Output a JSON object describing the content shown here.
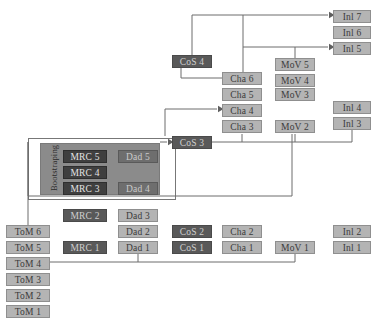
{
  "diagram": {
    "bootstrapping_label": "Bootstraping",
    "colors": {
      "node_fill": "#b4b4b4",
      "node_dark_fill": "#595959",
      "panel_fill": "#8b8b8b",
      "wire": "#6d6d6d",
      "page_background": "#ffffff"
    },
    "columns": [
      {
        "name": "ToM",
        "label": "ToM"
      },
      {
        "name": "MRC",
        "label": "MRC"
      },
      {
        "name": "Dad",
        "label": "Dad"
      },
      {
        "name": "CoS",
        "label": "CoS"
      },
      {
        "name": "Cha",
        "label": "Cha"
      },
      {
        "name": "MoV",
        "label": "MoV"
      },
      {
        "name": "Inl",
        "label": "Inl"
      }
    ],
    "nodes": [
      {
        "id": "tom6",
        "label": "ToM 6",
        "x": 6,
        "y": 225,
        "w": 44,
        "style": "light"
      },
      {
        "id": "tom5",
        "label": "ToM 5",
        "x": 6,
        "y": 241,
        "w": 44,
        "style": "light"
      },
      {
        "id": "tom4",
        "label": "ToM 4",
        "x": 6,
        "y": 257,
        "w": 44,
        "style": "light"
      },
      {
        "id": "tom3",
        "label": "ToM 3",
        "x": 6,
        "y": 273,
        "w": 44,
        "style": "light"
      },
      {
        "id": "tom2",
        "label": "ToM 2",
        "x": 6,
        "y": 289,
        "w": 44,
        "style": "light"
      },
      {
        "id": "tom1",
        "label": "ToM 1",
        "x": 6,
        "y": 305,
        "w": 44,
        "style": "light"
      },
      {
        "id": "mrc5",
        "label": "MRC 5",
        "x": 63,
        "y": 150,
        "w": 44,
        "style": "panel-dark"
      },
      {
        "id": "mrc4",
        "label": "MRC 4",
        "x": 63,
        "y": 166,
        "w": 44,
        "style": "panel-dark"
      },
      {
        "id": "mrc3",
        "label": "MRC 3",
        "x": 63,
        "y": 182,
        "w": 44,
        "style": "panel-dark"
      },
      {
        "id": "mrc2",
        "label": "MRC 2",
        "x": 63,
        "y": 209,
        "w": 44,
        "style": "dark"
      },
      {
        "id": "mrc1",
        "label": "MRC 1",
        "x": 63,
        "y": 241,
        "w": 44,
        "style": "dark"
      },
      {
        "id": "dad5",
        "label": "Dad 5",
        "x": 118,
        "y": 150,
        "w": 40,
        "style": "panel-soft"
      },
      {
        "id": "dad4",
        "label": "Dad 4",
        "x": 118,
        "y": 182,
        "w": 40,
        "style": "panel-soft"
      },
      {
        "id": "dad3",
        "label": "Dad 3",
        "x": 118,
        "y": 209,
        "w": 40,
        "style": "light"
      },
      {
        "id": "dad2",
        "label": "Dad 2",
        "x": 118,
        "y": 225,
        "w": 40,
        "style": "light"
      },
      {
        "id": "dad1",
        "label": "Dad 1",
        "x": 118,
        "y": 241,
        "w": 40,
        "style": "light"
      },
      {
        "id": "cos4",
        "label": "CoS 4",
        "x": 172,
        "y": 55,
        "w": 40,
        "style": "dark"
      },
      {
        "id": "cos3",
        "label": "CoS 3",
        "x": 172,
        "y": 136,
        "w": 40,
        "style": "dark"
      },
      {
        "id": "cos2",
        "label": "CoS 2",
        "x": 172,
        "y": 225,
        "w": 40,
        "style": "dark"
      },
      {
        "id": "cos1",
        "label": "CoS 1",
        "x": 172,
        "y": 241,
        "w": 40,
        "style": "dark"
      },
      {
        "id": "cha6",
        "label": "Cha 6",
        "x": 222,
        "y": 72,
        "w": 40,
        "style": "light"
      },
      {
        "id": "cha5",
        "label": "Cha 5",
        "x": 222,
        "y": 88,
        "w": 40,
        "style": "light"
      },
      {
        "id": "cha4",
        "label": "Cha 4",
        "x": 222,
        "y": 104,
        "w": 40,
        "style": "light"
      },
      {
        "id": "cha3",
        "label": "Cha 3",
        "x": 222,
        "y": 120,
        "w": 40,
        "style": "light"
      },
      {
        "id": "cha2",
        "label": "Cha 2",
        "x": 222,
        "y": 225,
        "w": 40,
        "style": "light"
      },
      {
        "id": "cha1",
        "label": "Cha 1",
        "x": 222,
        "y": 241,
        "w": 40,
        "style": "light"
      },
      {
        "id": "mov5",
        "label": "MoV 5",
        "x": 275,
        "y": 58,
        "w": 40,
        "style": "light"
      },
      {
        "id": "mov4",
        "label": "MoV 4",
        "x": 275,
        "y": 74,
        "w": 40,
        "style": "light"
      },
      {
        "id": "mov3",
        "label": "MoV 3",
        "x": 275,
        "y": 88,
        "w": 40,
        "style": "light"
      },
      {
        "id": "mov2",
        "label": "MoV 2",
        "x": 275,
        "y": 120,
        "w": 40,
        "style": "light"
      },
      {
        "id": "mov1",
        "label": "MoV 1",
        "x": 275,
        "y": 241,
        "w": 40,
        "style": "light"
      },
      {
        "id": "inl7",
        "label": "Inl 7",
        "x": 333,
        "y": 10,
        "w": 38,
        "style": "light"
      },
      {
        "id": "inl6",
        "label": "Inl 6",
        "x": 333,
        "y": 26,
        "w": 38,
        "style": "light"
      },
      {
        "id": "inl5",
        "label": "Inl 5",
        "x": 333,
        "y": 42,
        "w": 38,
        "style": "light"
      },
      {
        "id": "inl4",
        "label": "Inl 4",
        "x": 333,
        "y": 101,
        "w": 38,
        "style": "light"
      },
      {
        "id": "inl3",
        "label": "Inl 3",
        "x": 333,
        "y": 117,
        "w": 38,
        "style": "light"
      },
      {
        "id": "inl2",
        "label": "Inl 2",
        "x": 333,
        "y": 225,
        "w": 38,
        "style": "light"
      },
      {
        "id": "inl1",
        "label": "Inl 1",
        "x": 333,
        "y": 241,
        "w": 38,
        "style": "light"
      }
    ],
    "panel": {
      "x": 40,
      "y": 143,
      "w": 120,
      "h": 52
    },
    "frame": {
      "x": 28,
      "y": 138,
      "w": 148,
      "h": 62
    },
    "wires": [
      {
        "id": "cos4-to-inl7",
        "from": "cos4",
        "to": "inl7",
        "d": "M 192 55 L 192 15 L 328 15"
      },
      {
        "id": "cha6-to-inl7",
        "from": "cha6",
        "to": "inl7",
        "d": "M 243 72 L 243 15"
      },
      {
        "id": "cha6-to-inl5",
        "from": "cha6",
        "to": "inl5",
        "d": "M 243 47 L 328 47"
      },
      {
        "id": "mov5-to-inl5",
        "from": "mov5",
        "to": "inl5",
        "d": "M 295 58 L 295 47"
      },
      {
        "id": "cos4-to-cha6",
        "from": "cos4",
        "to": "cha6",
        "d": "M 181 67 L 181 78 L 222 78"
      },
      {
        "id": "cos3-to-cha4",
        "from": "cos3",
        "to": "cha4",
        "d": "M 165 136 L 165 109 L 217 109"
      },
      {
        "id": "dad5-to-cos3",
        "from": "dad5",
        "to": "cos3",
        "d": "M 160 142 L 167 142"
      },
      {
        "id": "cos3-to-cha3",
        "from": "cos3",
        "to": "cha3",
        "d": "M 212 142 L 242 142 L 242 134"
      },
      {
        "id": "cos3-to-mov2",
        "from": "cos3",
        "to": "mov2",
        "d": "M 242 142 L 295 142 L 295 134"
      },
      {
        "id": "inl3-to-mov2",
        "from": "inl3",
        "to": "mov2",
        "d": "M 352 130 L 352 142 L 295 142"
      },
      {
        "id": "panel-to-mov2",
        "from": "panel",
        "to": "mov2",
        "d": "M 28 142 L 28 196 L 292 196 L 292 134"
      },
      {
        "id": "panel-to-tom6",
        "from": "panel",
        "to": "tom6",
        "d": "M 28 142 L 28 225"
      },
      {
        "id": "tom4-to-dad1",
        "from": "tom4",
        "to": "dad1",
        "d": "M 50 262 L 138 262 L 138 254"
      },
      {
        "id": "tom4-to-mov1",
        "from": "tom4",
        "to": "mov1",
        "d": "M 138 262 L 295 262 L 295 254"
      }
    ],
    "arrowheads": [
      {
        "id": "arrow-inl7",
        "x": 329,
        "y": 15,
        "dir": "right"
      },
      {
        "id": "arrow-inl5",
        "x": 329,
        "y": 47,
        "dir": "right"
      },
      {
        "id": "arrow-cha4",
        "x": 218,
        "y": 109,
        "dir": "right"
      },
      {
        "id": "arrow-cos3",
        "x": 168,
        "y": 142,
        "dir": "right"
      },
      {
        "id": "arrow-cha3",
        "x": 242,
        "y": 133,
        "dir": "up"
      },
      {
        "id": "arrow-mov2",
        "x": 294,
        "y": 133,
        "dir": "up"
      },
      {
        "id": "arrow-dad1",
        "x": 138,
        "y": 254,
        "dir": "up"
      },
      {
        "id": "arrow-mov1",
        "x": 295,
        "y": 254,
        "dir": "up"
      }
    ]
  }
}
